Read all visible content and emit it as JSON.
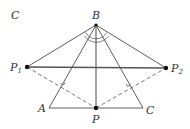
{
  "figure": {
    "panel_label": "C",
    "points": {
      "B": {
        "label": "B",
        "x": 96,
        "y": 25
      },
      "P1": {
        "label": "P",
        "sub": "1",
        "x": 27,
        "y": 67
      },
      "P2": {
        "label": "P",
        "sub": "2",
        "x": 166,
        "y": 68
      },
      "A": {
        "label": "A",
        "x": 49,
        "y": 108
      },
      "C": {
        "label": "C",
        "x": 143,
        "y": 108
      },
      "P": {
        "label": "P",
        "x": 96,
        "y": 108
      }
    },
    "colors": {
      "line": "#333333",
      "thick_line": "#555555",
      "dashed": "#555555",
      "point": "#111111"
    }
  }
}
